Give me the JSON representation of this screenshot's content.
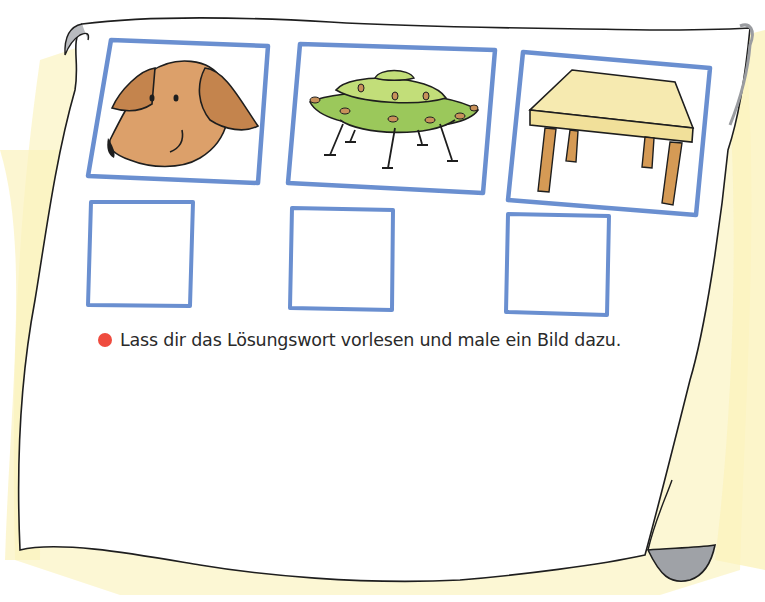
{
  "worksheet": {
    "instruction": {
      "bullet_color": "#ef4b3e",
      "text": "Lass dir das Lösungswort vorlesen und male ein Bild dazu."
    },
    "pictures": [
      {
        "name": "dog",
        "label": "Hund"
      },
      {
        "name": "ufo",
        "label": "UFO"
      },
      {
        "name": "table",
        "label": "Tisch"
      }
    ],
    "answer_boxes": [
      {
        "index": 1,
        "value": ""
      },
      {
        "index": 2,
        "value": ""
      },
      {
        "index": 3,
        "value": ""
      }
    ],
    "colors": {
      "frame_blue": "#6a8fd0",
      "paper_shadow": "#fbf6c8",
      "curl_gray": "#a9abb0",
      "outline": "#1e1e1e"
    }
  }
}
